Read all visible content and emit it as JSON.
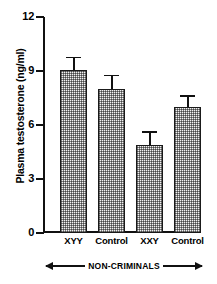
{
  "chart_data": {
    "type": "bar",
    "title": "",
    "xlabel": "",
    "ylabel": "Plasma testosterone (ng/ml)",
    "ylim": [
      0,
      12
    ],
    "yticks": [
      "0",
      "3",
      "6",
      "9",
      "12"
    ],
    "grid": false,
    "legend": null,
    "categories": [
      "XYY",
      "Control",
      "XXY",
      "Control"
    ],
    "values": [
      9.05,
      8.0,
      4.9,
      7.0
    ],
    "errors": [
      0.65,
      0.7,
      0.65,
      0.55
    ],
    "annotations": [
      {
        "text": "NON-CRIMINALS",
        "style": "double-headed-arrow",
        "position": "below-x-axis",
        "spans": [
          "XYY",
          "Control",
          "XXY",
          "Control"
        ]
      }
    ],
    "bar_fill": "stippled-checkerboard",
    "bar_edge_color": "#1a1a1a",
    "bar_fill_color": "#f2f2f2",
    "axis_color": "#111111",
    "background_color": "#ffffff"
  },
  "axes": {
    "y_title": "Plasma testosterone (ng/ml)",
    "y_ticks": [
      {
        "label": "12",
        "value": 12
      },
      {
        "label": "9",
        "value": 9
      },
      {
        "label": "6",
        "value": 6
      },
      {
        "label": "3",
        "value": 3
      },
      {
        "label": "0",
        "value": 0
      }
    ],
    "x_ticks": [
      {
        "label": "XYY"
      },
      {
        "label": "Control"
      },
      {
        "label": "XXY"
      },
      {
        "label": "Control"
      }
    ]
  },
  "group_annotation": {
    "label": "NON-CRIMINALS"
  }
}
